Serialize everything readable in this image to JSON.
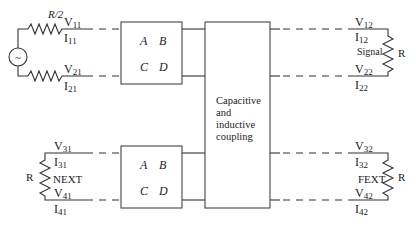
{
  "diagram": {
    "source": {
      "label": "~",
      "series_resistor_label": "R/2"
    },
    "ports": {
      "v11": {
        "main": "V",
        "sub": "11"
      },
      "i11": {
        "main": "I",
        "sub": "11"
      },
      "v21": {
        "main": "V",
        "sub": "21"
      },
      "i21": {
        "main": "I",
        "sub": "21"
      },
      "v12": {
        "main": "V",
        "sub": "12"
      },
      "i12": {
        "main": "I",
        "sub": "12"
      },
      "v22": {
        "main": "V",
        "sub": "22"
      },
      "i22": {
        "main": "I",
        "sub": "22"
      },
      "v31": {
        "main": "V",
        "sub": "31"
      },
      "i31": {
        "main": "I",
        "sub": "31"
      },
      "v41": {
        "main": "V",
        "sub": "41"
      },
      "i41": {
        "main": "I",
        "sub": "41"
      },
      "v32": {
        "main": "V",
        "sub": "32"
      },
      "i32": {
        "main": "I",
        "sub": "32"
      },
      "v42": {
        "main": "V",
        "sub": "42"
      },
      "i42": {
        "main": "I",
        "sub": "42"
      }
    },
    "abcd_top": {
      "a": "A",
      "b": "B",
      "c": "C",
      "d": "D"
    },
    "abcd_bottom": {
      "a": "A",
      "b": "B",
      "c": "C",
      "d": "D"
    },
    "coupling_box": {
      "lines": [
        "Capacitive",
        "and",
        "inductive",
        "coupling"
      ]
    },
    "loads": {
      "signal": {
        "label": "Signal",
        "resistor": "R"
      },
      "next": {
        "label": "NEXT",
        "resistor": "R"
      },
      "fext": {
        "label": "FEXT",
        "resistor": "R"
      }
    }
  }
}
